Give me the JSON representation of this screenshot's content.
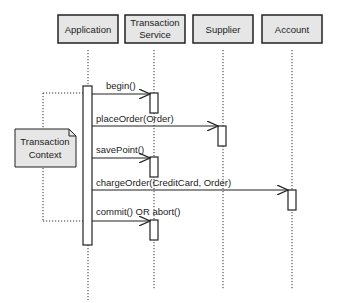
{
  "diagram": {
    "type": "uml-sequence",
    "participants": [
      {
        "id": "app",
        "label_lines": [
          "Application"
        ]
      },
      {
        "id": "ts",
        "label_lines": [
          "Transaction",
          "Service"
        ]
      },
      {
        "id": "supplier",
        "label_lines": [
          "Supplier"
        ]
      },
      {
        "id": "account",
        "label_lines": [
          "Account"
        ]
      }
    ],
    "messages": [
      {
        "from": "app",
        "to": "ts",
        "label": "begin()"
      },
      {
        "from": "app",
        "to": "supplier",
        "label": "placeOrder(Order)"
      },
      {
        "from": "app",
        "to": "ts",
        "label": "savePoint()"
      },
      {
        "from": "app",
        "to": "account",
        "label": "chargeOrder(CreditCard, Order)"
      },
      {
        "from": "app",
        "to": "ts",
        "label": "commit() OR abort()"
      }
    ],
    "note": {
      "label_lines": [
        "Transaction",
        "Context"
      ],
      "spans_messages": [
        "begin()",
        "commit() OR abort()"
      ]
    },
    "colors": {
      "box_fill": "#e6e6e6",
      "stroke": "#222222",
      "background": "#ffffff"
    }
  }
}
